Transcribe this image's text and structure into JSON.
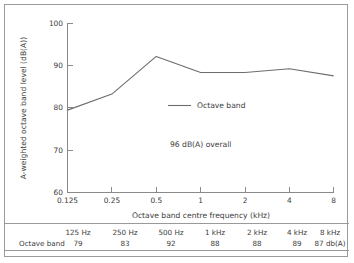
{
  "chart_data": {
    "type": "line",
    "title": "",
    "xlabel": "Octave band centre frequency (kHz)",
    "ylabel": "A-weighted octave band level (dB(A))",
    "x": [
      0.125,
      0.25,
      0.5,
      1,
      2,
      4,
      8
    ],
    "xtick_labels": [
      "0.125",
      "0.25",
      "0.5",
      "1",
      "2",
      "4",
      "8"
    ],
    "ytick_labels": [
      "60",
      "70",
      "80",
      "90",
      "100"
    ],
    "yticks": [
      60,
      70,
      80,
      90,
      100
    ],
    "ylim": [
      60,
      100
    ],
    "grid": false,
    "legend_position": "inside-center",
    "series": [
      {
        "name": "Octave band",
        "values": [
          79.5,
          83.3,
          92.2,
          88.4,
          88.4,
          89.3,
          87.6
        ]
      }
    ],
    "annotations": [
      {
        "text": "96 dB(A) overall"
      }
    ]
  },
  "legend": {
    "label": "Octave band"
  },
  "annotation": {
    "overall": "96 dB(A) overall"
  },
  "axes": {
    "y_title": "A-weighted octave band level (dB(A))",
    "x_title": "Octave band centre frequency (kHz)",
    "y_ticks": [
      "100",
      "90",
      "80",
      "70",
      "60"
    ],
    "x_ticks": [
      "0.125",
      "0.25",
      "0.5",
      "1",
      "2",
      "4",
      "8"
    ]
  },
  "table": {
    "row_label": "Octave band",
    "header": [
      "125 Hz",
      "250 Hz",
      "500 Hz",
      "1 kHz",
      "2 kHz",
      "4 kHz",
      "8 kHz"
    ],
    "values": [
      "79",
      "83",
      "92",
      "88",
      "88",
      "89",
      "87 db(A)"
    ]
  }
}
